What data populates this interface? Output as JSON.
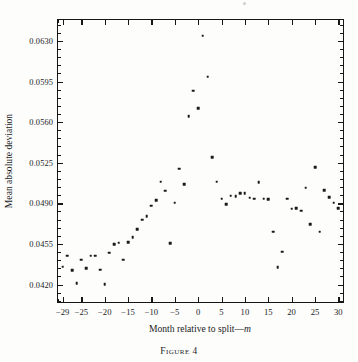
{
  "figure": {
    "caption": "Figure 4"
  },
  "chart_data": {
    "type": "scatter",
    "title": "",
    "xlabel": "Month relative to split—m",
    "xlabel_plain": "Month relative to split",
    "xlabel_italic_suffix": "m",
    "ylabel": "Mean absolute deviation",
    "xlim": [
      -30,
      31
    ],
    "ylim": [
      0.0405,
      0.0648
    ],
    "grid": false,
    "legend": null,
    "xticks": [
      -29,
      -25,
      -20,
      -15,
      -10,
      -5,
      0,
      5,
      10,
      15,
      20,
      25,
      30
    ],
    "xtick_labels": [
      "−29",
      "−25",
      "−20",
      "−15",
      "−10",
      "−5",
      "0",
      "5",
      "10",
      "15",
      "20",
      "25",
      "30"
    ],
    "xtick_minor_step": 1,
    "yticks": [
      0.042,
      0.0455,
      0.049,
      0.0525,
      0.056,
      0.0595,
      0.063
    ],
    "ytick_labels": [
      "0.0420",
      "0.0455",
      "0.0490",
      "0.0525",
      "0.0560",
      "0.0595",
      "0.0630"
    ],
    "ytick_minor_count_between": 4,
    "marker": "square",
    "marker_color": "#1a1a1a",
    "x": [
      -29,
      -28,
      -27,
      -26,
      -25,
      -24,
      -23,
      -22,
      -21,
      -20,
      -19,
      -18,
      -17,
      -16,
      -15,
      -14,
      -13,
      -12,
      -11,
      -10,
      -9,
      -8,
      -7,
      -6,
      -5,
      -4,
      -3,
      -2,
      -1,
      0,
      1,
      2,
      3,
      4,
      5,
      6,
      7,
      8,
      9,
      10,
      11,
      12,
      13,
      14,
      15,
      16,
      17,
      18,
      19,
      20,
      21,
      22,
      23,
      24,
      25,
      26,
      27,
      28,
      29,
      30
    ],
    "y": [
      0.04355,
      0.0445,
      0.04325,
      0.0421,
      0.04415,
      0.0434,
      0.0445,
      0.0445,
      0.0433,
      0.04205,
      0.04475,
      0.0455,
      0.0456,
      0.04415,
      0.04565,
      0.0461,
      0.04675,
      0.0476,
      0.0479,
      0.0488,
      0.04925,
      0.05085,
      0.0501,
      0.04555,
      0.04905,
      0.052,
      0.05065,
      0.0565,
      0.0587,
      0.0572,
      0.06345,
      0.0599,
      0.053,
      0.05085,
      0.0494,
      0.04895,
      0.04965,
      0.0496,
      0.04985,
      0.0499,
      0.0495,
      0.0494,
      0.0508,
      0.0494,
      0.04935,
      0.04655,
      0.0435,
      0.04485,
      0.0494,
      0.04855,
      0.0486,
      0.04835,
      0.05035,
      0.0472,
      0.0521,
      0.04655,
      0.05015,
      0.04955,
      0.04905,
      0.0486
    ]
  }
}
